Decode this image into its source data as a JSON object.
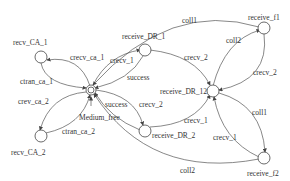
{
  "diagram": {
    "type": "state-transition",
    "nodes": [
      {
        "id": "medium_free",
        "label": "Medium_free"
      },
      {
        "id": "recv_ca_1",
        "label": "recv_CA_1"
      },
      {
        "id": "recv_ca_2",
        "label": "recv_CA_2"
      },
      {
        "id": "receive_dr_1",
        "label": "receive_DR_1"
      },
      {
        "id": "receive_dr_2",
        "label": "receive_DR_2"
      },
      {
        "id": "receive_dr_12",
        "label": "receive_DR_12"
      },
      {
        "id": "receive_f1",
        "label": "receive_f1"
      },
      {
        "id": "receive_f2",
        "label": "receive_f2"
      }
    ],
    "edges": [
      {
        "from": "medium_free",
        "to": "recv_ca_1",
        "label": "crecv_ca_1"
      },
      {
        "from": "recv_ca_1",
        "to": "medium_free",
        "label": "ctran_ca_1"
      },
      {
        "from": "medium_free",
        "to": "recv_ca_2",
        "label": "crev_ca_2"
      },
      {
        "from": "recv_ca_2",
        "to": "medium_free",
        "label": "ctran_ca_2"
      },
      {
        "from": "medium_free",
        "to": "receive_dr_1",
        "label": "crecv_1"
      },
      {
        "from": "receive_dr_1",
        "to": "medium_free",
        "label": "success"
      },
      {
        "from": "medium_free",
        "to": "receive_dr_2",
        "label": "crecv_2"
      },
      {
        "from": "receive_dr_2",
        "to": "medium_free",
        "label": "success"
      },
      {
        "from": "receive_dr_1",
        "to": "receive_dr_12",
        "label": "crecv_2"
      },
      {
        "from": "receive_dr_2",
        "to": "receive_dr_12",
        "label": "crecv_1"
      },
      {
        "from": "receive_dr_12",
        "to": "receive_f1",
        "label": "coll2"
      },
      {
        "from": "receive_f1",
        "to": "receive_dr_12",
        "label": "crecv_2"
      },
      {
        "from": "receive_dr_12",
        "to": "receive_f2",
        "label": "coll1"
      },
      {
        "from": "receive_f2",
        "to": "receive_dr_12",
        "label": "crecv_1"
      },
      {
        "from": "receive_f1",
        "to": "medium_free",
        "label": "coll1"
      },
      {
        "from": "receive_f2",
        "to": "medium_free",
        "label": "coll2"
      }
    ],
    "initial_marker_label": "Medium_free"
  }
}
